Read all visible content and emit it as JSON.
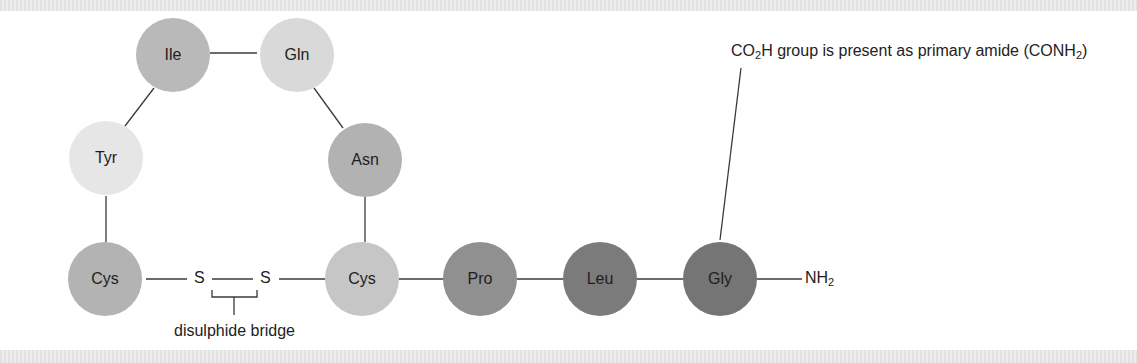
{
  "diagram": {
    "type": "peptide-structure",
    "residues": [
      {
        "id": "ile",
        "label": "Ile",
        "x": 173,
        "y": 55,
        "color": "#b9b9b9"
      },
      {
        "id": "gln",
        "label": "Gln",
        "x": 297,
        "y": 55,
        "color": "#d9d9d9"
      },
      {
        "id": "tyr",
        "label": "Tyr",
        "x": 106,
        "y": 158,
        "color": "#e6e6e6"
      },
      {
        "id": "asn",
        "label": "Asn",
        "x": 365,
        "y": 160,
        "color": "#b2b2b2"
      },
      {
        "id": "cys1",
        "label": "Cys",
        "x": 105,
        "y": 279,
        "color": "#b3b3b3"
      },
      {
        "id": "cys2",
        "label": "Cys",
        "x": 362,
        "y": 279,
        "color": "#c6c6c6"
      },
      {
        "id": "pro",
        "label": "Pro",
        "x": 480,
        "y": 279,
        "color": "#909090"
      },
      {
        "id": "leu",
        "label": "Leu",
        "x": 600,
        "y": 279,
        "color": "#7b7b7b"
      },
      {
        "id": "gly",
        "label": "Gly",
        "x": 720,
        "y": 279,
        "color": "#757575"
      }
    ],
    "sulfur_left": "S",
    "sulfur_right": "S",
    "terminal_group": {
      "main": "NH",
      "sub": "2"
    },
    "bridge_label": "disulphide bridge",
    "annotation": {
      "part1": "CO",
      "sub1": "2",
      "part2": "H group is present as primary amide (CONH",
      "sub2": "2",
      "part3": ")"
    }
  }
}
